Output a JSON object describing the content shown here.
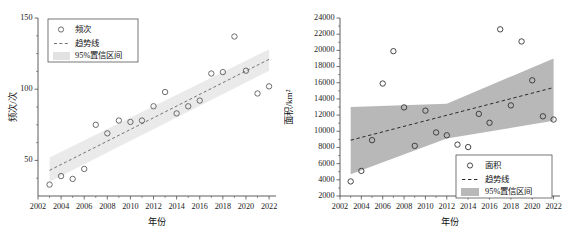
{
  "chart_data": [
    {
      "type": "scatter",
      "panel": "left",
      "title": "",
      "xlabel": "年份",
      "ylabel": "频次/次",
      "xlim": [
        2002,
        2022.6
      ],
      "ylim": [
        25,
        150
      ],
      "xticks": [
        2002,
        2004,
        2006,
        2008,
        2010,
        2012,
        2014,
        2016,
        2018,
        2020,
        2022
      ],
      "yticks": [
        50,
        100,
        150
      ],
      "grid": false,
      "legend_position": "top-left",
      "legend": [
        {
          "label": "频次",
          "marker": "circle"
        },
        {
          "label": "趋势线",
          "marker": "dashed-line"
        },
        {
          "label": "95%置信区间",
          "marker": "band"
        }
      ],
      "series": [
        {
          "name": "频次",
          "x": [
            2003,
            2004,
            2005,
            2006,
            2007,
            2008,
            2009,
            2010,
            2011,
            2012,
            2013,
            2014,
            2015,
            2016,
            2017,
            2018,
            2019,
            2020,
            2021,
            2022
          ],
          "values": [
            33,
            39,
            37,
            44,
            75,
            69,
            78,
            77,
            78,
            88,
            98,
            83,
            88,
            92,
            111,
            112,
            137,
            113,
            97,
            102
          ]
        }
      ],
      "trend": {
        "name": "趋势线",
        "x": [
          2003,
          2022
        ],
        "y": [
          43,
          121
        ]
      },
      "confidence_band": {
        "name": "95%置信区间",
        "x": [
          2003,
          2022
        ],
        "upper": [
          52,
          128
        ],
        "lower": [
          35,
          113
        ]
      }
    },
    {
      "type": "scatter",
      "panel": "right",
      "title": "",
      "xlabel": "年份",
      "ylabel": "面积/km²",
      "xlim": [
        2002,
        2022.6
      ],
      "ylim": [
        2000,
        24000
      ],
      "xticks": [
        2002,
        2004,
        2006,
        2008,
        2010,
        2012,
        2014,
        2016,
        2018,
        2020,
        2022
      ],
      "yticks": [
        2000,
        4000,
        6000,
        8000,
        10000,
        12000,
        14000,
        16000,
        18000,
        20000,
        22000,
        24000
      ],
      "grid": false,
      "legend_position": "bottom-right",
      "legend": [
        {
          "label": "面积",
          "marker": "circle"
        },
        {
          "label": "趋势线",
          "marker": "dashed-line"
        },
        {
          "label": "95%置信区间",
          "marker": "band"
        }
      ],
      "series": [
        {
          "name": "面积",
          "x": [
            2003,
            2004,
            2005,
            2006,
            2007,
            2008,
            2009,
            2010,
            2011,
            2012,
            2013,
            2014,
            2015,
            2016,
            2017,
            2018,
            2019,
            2020,
            2021,
            2022
          ],
          "values": [
            3800,
            5100,
            8900,
            15900,
            19900,
            12950,
            8200,
            12550,
            9850,
            9500,
            8350,
            8050,
            12150,
            11050,
            22600,
            13200,
            21100,
            16300,
            11850,
            11450
          ]
        }
      ],
      "trend": {
        "name": "趋势线",
        "x": [
          2003,
          2022
        ],
        "y": [
          8900,
          15400
        ]
      },
      "confidence_band": {
        "name": "95%置信区间",
        "x": [
          2003,
          2012,
          2022
        ],
        "upper": [
          13000,
          13400,
          19000
        ],
        "lower": [
          4700,
          9100,
          11300
        ]
      }
    }
  ]
}
